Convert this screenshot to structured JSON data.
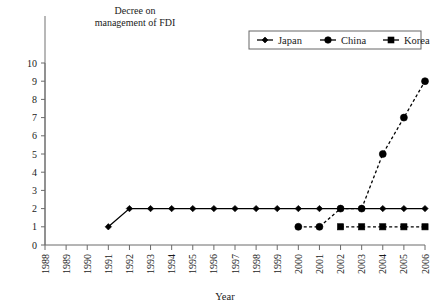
{
  "chart_data": {
    "type": "line",
    "title": "",
    "xlabel": "Year",
    "ylabel": "",
    "categories": [
      "1988",
      "1989",
      "1990",
      "1991",
      "1992",
      "1993",
      "1994",
      "1995",
      "1996",
      "1997",
      "1998",
      "1999",
      "2000",
      "2001",
      "2002",
      "2003",
      "2004",
      "2005",
      "2006"
    ],
    "ylim": [
      0,
      10
    ],
    "ytick_labels": [
      "0",
      "1",
      "2",
      "3",
      "4",
      "5",
      "6",
      "7",
      "8",
      "9",
      "10"
    ],
    "grid": false,
    "legend_position": "top-right",
    "series": [
      {
        "name": "Japan",
        "marker": "diamond",
        "linestyle": "solid",
        "color": "#000000",
        "x": [
          "1991",
          "1992",
          "1993",
          "1994",
          "1995",
          "1996",
          "1997",
          "1998",
          "1999",
          "2000",
          "2001",
          "2002",
          "2003",
          "2004",
          "2005",
          "2006"
        ],
        "values": [
          1,
          2,
          2,
          2,
          2,
          2,
          2,
          2,
          2,
          2,
          2,
          2,
          2,
          2,
          2,
          2
        ]
      },
      {
        "name": "China",
        "marker": "circle",
        "linestyle": "dashed",
        "color": "#000000",
        "x": [
          "2000",
          "2001",
          "2002",
          "2003",
          "2004",
          "2005",
          "2006"
        ],
        "values": [
          1,
          1,
          2,
          2,
          5,
          7,
          9
        ]
      },
      {
        "name": "Korea",
        "marker": "square",
        "linestyle": "dashed",
        "color": "#000000",
        "x": [
          "2002",
          "2003",
          "2004",
          "2005",
          "2006"
        ],
        "values": [
          1,
          1,
          1,
          1,
          1
        ]
      }
    ],
    "annotations": [
      {
        "text_line1": "Decree on",
        "text_line2": "management of FDI",
        "at_category": "1988",
        "type": "vertical-line-with-label",
        "color": "#9a9a9a"
      }
    ]
  },
  "legend": {
    "items": [
      {
        "label": "Japan",
        "marker": "diamond"
      },
      {
        "label": "China",
        "marker": "circle"
      },
      {
        "label": "Korea",
        "marker": "square"
      }
    ]
  }
}
